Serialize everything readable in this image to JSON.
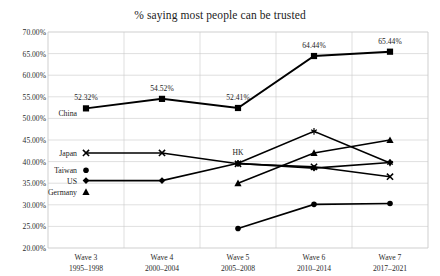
{
  "chart_data": {
    "type": "line",
    "title": "% saying most people can be trusted",
    "xlabel": "",
    "ylabel": "",
    "ylim": [
      20,
      70
    ],
    "ytick_labels": [
      "70.00%",
      "65.00%",
      "60.00%",
      "55.00%",
      "50.00%",
      "45.00%",
      "40.00%",
      "35.00%",
      "30.00%",
      "25.00%",
      "20.00%"
    ],
    "ytick_values": [
      70,
      65,
      60,
      55,
      50,
      45,
      40,
      35,
      30,
      25,
      20
    ],
    "grid": true,
    "legend_position": "inline-left",
    "categories": [
      "Wave 3",
      "Wave 4",
      "Wave 5",
      "Wave 6",
      "Wave 7"
    ],
    "category_sublabels": [
      "1995–1998",
      "2000–2004",
      "2005–2008",
      "2010–2014",
      "2017–2021"
    ],
    "series": [
      {
        "name": "China",
        "marker": "square",
        "values": [
          52.32,
          54.52,
          52.41,
          64.44,
          65.44
        ],
        "data_labels": [
          "52.32%",
          "54.52%",
          "52.41%",
          "64.44%",
          "65.44%"
        ]
      },
      {
        "name": "Japan",
        "marker": "x",
        "values": [
          42.0,
          42.0,
          39.5,
          38.8,
          36.5
        ],
        "data_labels": [
          "",
          "",
          "",
          "",
          ""
        ]
      },
      {
        "name": "Taiwan",
        "marker": "circle",
        "values": [
          null,
          null,
          24.5,
          30.1,
          30.3
        ],
        "data_labels": [
          "",
          "",
          "",
          "",
          ""
        ]
      },
      {
        "name": "US",
        "marker": "diamond",
        "values": [
          35.6,
          35.6,
          39.6,
          38.5,
          39.8
        ],
        "data_labels": [
          "",
          "",
          "",
          "",
          ""
        ]
      },
      {
        "name": "Germany",
        "marker": "triangle",
        "values": [
          null,
          null,
          35.0,
          42.0,
          45.0
        ],
        "data_labels": [
          "",
          "",
          "",
          "",
          ""
        ]
      },
      {
        "name": "HK",
        "marker": "asterisk",
        "values": [
          null,
          null,
          39.6,
          47.0,
          39.7
        ],
        "data_labels": [
          "",
          "",
          "",
          "",
          ""
        ]
      }
    ],
    "annotations": [
      {
        "text": "HK",
        "series": "HK",
        "category": "Wave 5"
      }
    ],
    "series_labels_left": [
      "China",
      "Japan",
      "Taiwan",
      "US",
      "Germany"
    ],
    "colors": {
      "line": "#000000",
      "grid": "#c9c9c9",
      "axis": "#8a8a8a",
      "text": "#1c1c1c"
    }
  }
}
